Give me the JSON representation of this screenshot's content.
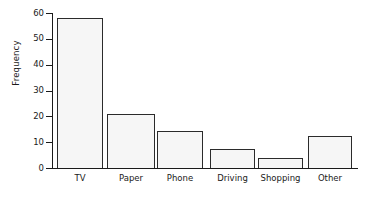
{
  "chart_data": {
    "type": "bar",
    "title": "",
    "subtitle": "",
    "xlabel": "",
    "ylabel": "Frequency",
    "categories": [
      "TV",
      "Paper",
      "Phone",
      "Driving",
      "Shopping",
      "Other"
    ],
    "values": [
      58,
      21,
      14.5,
      7.5,
      4,
      12.5
    ],
    "series": [
      {
        "name": "Frequency",
        "values": [
          58,
          21,
          14.5,
          7.5,
          4,
          12.5
        ]
      }
    ],
    "ylim": [
      0,
      60
    ],
    "xlim_note": "categorical",
    "ytick_labels": [
      "0",
      "10",
      "20",
      "30",
      "40",
      "50",
      "60"
    ],
    "ytick_values": [
      0,
      10,
      20,
      30,
      40,
      50,
      60
    ],
    "grid": false,
    "legend": false,
    "legend_position": "none",
    "annotations": [],
    "colors": {
      "bar_fill": "#f6f6f6",
      "bar_edge": "#2b2b2b",
      "axis": "#1a1a1a",
      "text": "#1a1a1a",
      "background": "#ffffff"
    }
  },
  "axes": {
    "y_title": "Frequency",
    "ticks": [
      {
        "label": "60",
        "value": 60
      },
      {
        "label": "50",
        "value": 50
      },
      {
        "label": "40",
        "value": 40
      },
      {
        "label": "30",
        "value": 30
      },
      {
        "label": "20",
        "value": 20
      },
      {
        "label": "10",
        "value": 10
      },
      {
        "label": "0",
        "value": 0
      }
    ]
  },
  "bars": [
    {
      "label": "TV",
      "value": 58
    },
    {
      "label": "Paper",
      "value": 21
    },
    {
      "label": "Phone",
      "value": 14.5
    },
    {
      "label": "Driving",
      "value": 7.5
    },
    {
      "label": "Shopping",
      "value": 4
    },
    {
      "label": "Other",
      "value": 12.5
    }
  ]
}
